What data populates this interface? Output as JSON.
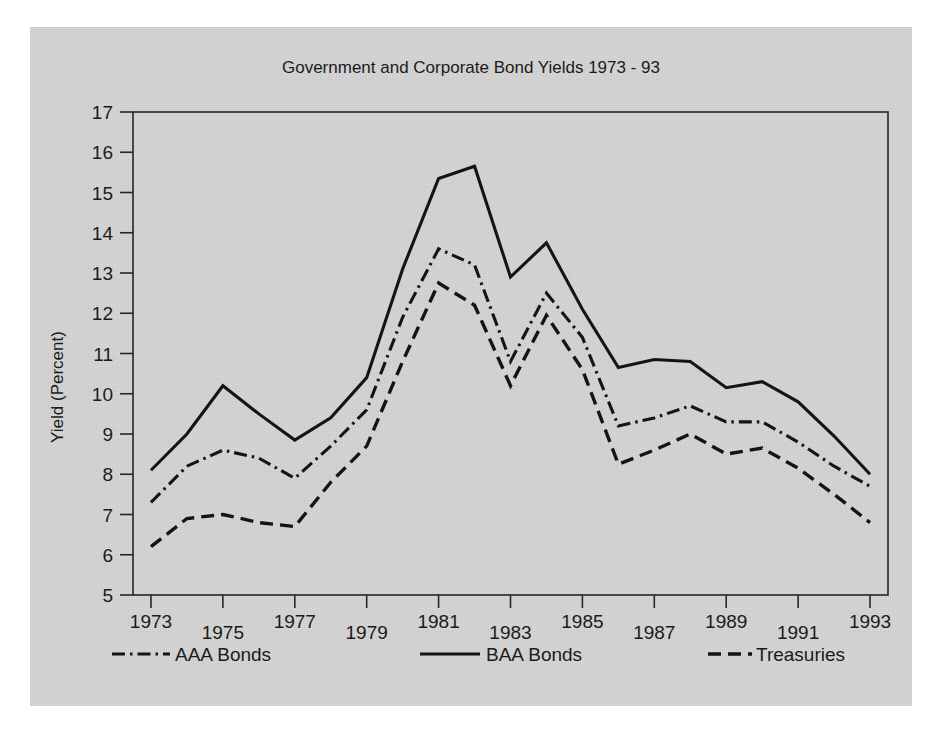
{
  "figure": {
    "background_color": "#d6d6d6",
    "page_color": "#ffffff",
    "ink_color": "#141414"
  },
  "chart_data": {
    "type": "line",
    "title": "Government and Corporate Bond Yields 1973 - 93",
    "xlabel": "",
    "ylabel": "Yield (Percent)",
    "xlim": [
      1972.5,
      1993.5
    ],
    "ylim": [
      5,
      17
    ],
    "yticks": [
      5,
      6,
      7,
      8,
      9,
      10,
      11,
      12,
      13,
      14,
      15,
      16,
      17
    ],
    "ytick_labels": [
      "5",
      "6",
      "7",
      "8",
      "9",
      "10",
      "11",
      "12",
      "13",
      "14",
      "15",
      "16",
      "17"
    ],
    "xticks": [
      1973,
      1975,
      1977,
      1979,
      1981,
      1983,
      1985,
      1987,
      1989,
      1991,
      1993
    ],
    "xtick_labels": [
      "1973",
      "1975",
      "1977",
      "1979",
      "1981",
      "1983",
      "1985",
      "1987",
      "1989",
      "1991",
      "1993"
    ],
    "grid": false,
    "legend_position": "below-axes",
    "x": [
      1973,
      1974,
      1975,
      1976,
      1977,
      1978,
      1979,
      1980,
      1981,
      1982,
      1983,
      1984,
      1985,
      1986,
      1987,
      1988,
      1989,
      1990,
      1991,
      1992,
      1993
    ],
    "series": [
      {
        "name": "AAA Bonds",
        "linestyle": "dash-dot",
        "values": [
          7.3,
          8.2,
          8.6,
          8.4,
          7.9,
          8.7,
          9.6,
          11.9,
          13.6,
          13.2,
          10.8,
          12.5,
          11.4,
          9.2,
          9.4,
          9.7,
          9.3,
          9.3,
          8.8,
          8.2,
          7.7
        ]
      },
      {
        "name": "BAA Bonds",
        "linestyle": "solid",
        "values": [
          8.1,
          9.0,
          10.2,
          9.5,
          8.85,
          9.4,
          10.4,
          13.1,
          15.35,
          15.65,
          12.9,
          13.75,
          12.1,
          10.65,
          10.85,
          10.8,
          10.15,
          10.3,
          9.8,
          8.95,
          8.0
        ]
      },
      {
        "name": "Treasuries",
        "linestyle": "dashed",
        "values": [
          6.2,
          6.9,
          7.0,
          6.8,
          6.7,
          7.8,
          8.7,
          10.8,
          12.75,
          12.2,
          10.2,
          11.95,
          10.6,
          8.25,
          8.6,
          9.0,
          8.5,
          8.65,
          8.15,
          7.5,
          6.8
        ]
      }
    ]
  },
  "legend": {
    "items": [
      {
        "label": "AAA Bonds",
        "style": "dash-dot"
      },
      {
        "label": "BAA Bonds",
        "style": "solid"
      },
      {
        "label": "Treasuries",
        "style": "dashed"
      }
    ]
  }
}
